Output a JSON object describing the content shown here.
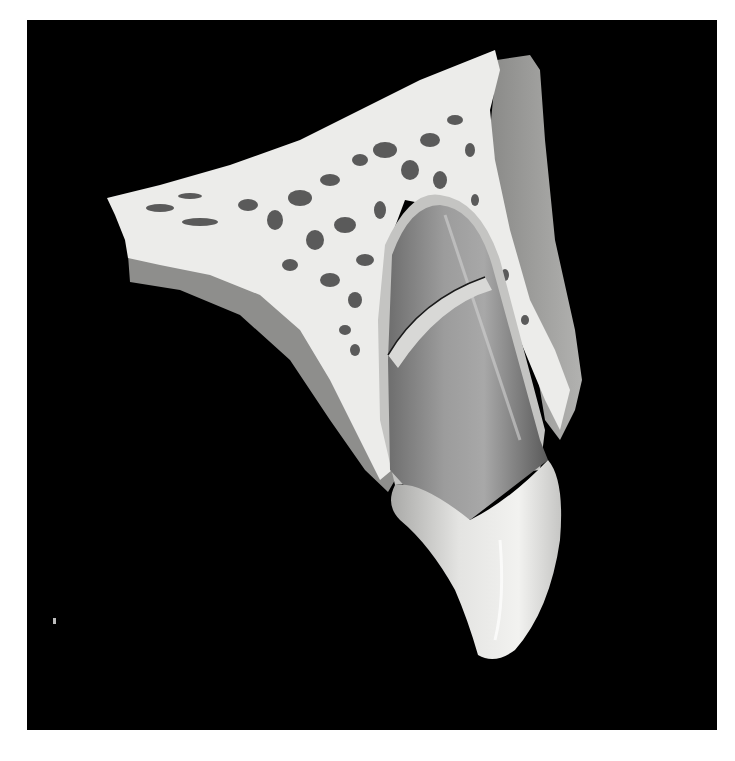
{
  "figure": {
    "background_color": "#000000",
    "page_color": "#ffffff",
    "colors": {
      "bone": "#ececea",
      "bone_pores": "#4a4a4a",
      "gingiva": "#9a9a98",
      "root": "#8a8a8a",
      "crown": "#dcdcda",
      "ligament": "#c8c8c6",
      "fracture_line": "#1a1a1a"
    },
    "structures": [
      "alveolar-bone",
      "trabecular-pores",
      "periosteum-gingiva",
      "periodontal-ligament",
      "tooth-root",
      "root-fracture",
      "tooth-crown"
    ]
  }
}
